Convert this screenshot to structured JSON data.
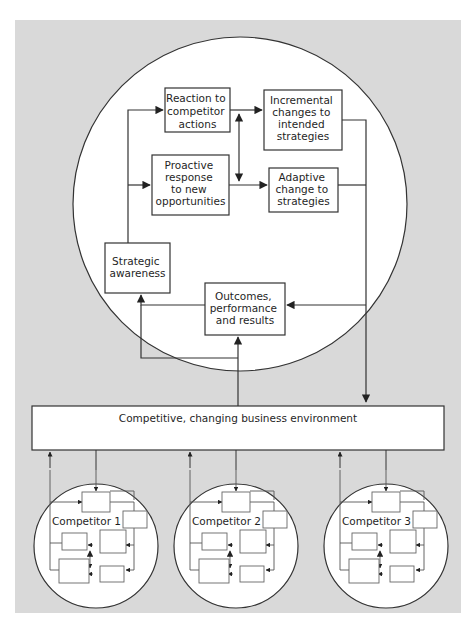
{
  "diagram": {
    "colors": {
      "background": "#d9d9d9",
      "page": "#ffffff",
      "circle_fill": "#ffffff",
      "stroke": "#333333",
      "arrow": "#222222",
      "text": "#1f1f1f"
    },
    "main_cycle": {
      "boxes": {
        "reaction": [
          "Reaction to",
          "competitor",
          "actions"
        ],
        "incremental": [
          "Incremental",
          "changes to",
          "intended",
          "strategies"
        ],
        "proactive": [
          "Proactive",
          "response",
          "to new",
          "opportunities"
        ],
        "adaptive": [
          "Adaptive",
          "change to",
          "strategies"
        ],
        "strategic_awareness": [
          "Strategic",
          "awareness"
        ],
        "outcomes": [
          "Outcomes,",
          "performance",
          "and results"
        ]
      }
    },
    "environment": {
      "label": "Competitive, changing business environment"
    },
    "competitors": [
      {
        "label": "Competitor 1"
      },
      {
        "label": "Competitor 2"
      },
      {
        "label": "Competitor 3"
      }
    ]
  }
}
